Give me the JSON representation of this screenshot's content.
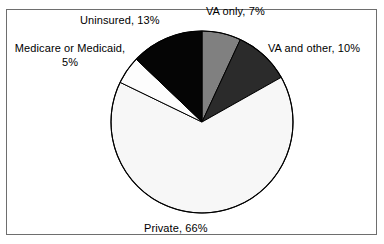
{
  "chart_data": {
    "type": "pie",
    "title": "",
    "subtitle": "",
    "xlabel": "",
    "ylabel": "",
    "legend_position": "none",
    "grid": false,
    "start_angle_deg": 0,
    "direction": "clockwise",
    "categories": [
      "VA only",
      "VA and other",
      "Private",
      "Medicare or Medicaid",
      "Uninsured"
    ],
    "values": [
      7,
      10,
      66,
      5,
      13
    ],
    "unit": "%",
    "total": 101,
    "slices": [
      {
        "name": "VA only",
        "value": 7,
        "label": "VA only, 7%",
        "color": "#808080",
        "stroke": "#000000"
      },
      {
        "name": "VA and other",
        "value": 10,
        "label": "VA and other, 10%",
        "color": "#2b2b2b",
        "stroke": "#000000"
      },
      {
        "name": "Private",
        "value": 66,
        "label": "Private, 66%",
        "color": "#f7f7f7",
        "stroke": "#000000"
      },
      {
        "name": "Medicare or Medicaid",
        "value": 5,
        "label_line1": "Medicare or Medicaid,",
        "label_line2": "5%",
        "label": "Medicare or Medicaid, 5%",
        "color": "#fdfdfd",
        "stroke": "#000000"
      },
      {
        "name": "Uninsured",
        "value": 13,
        "label": "Uninsured, 13%",
        "color": "#050505",
        "stroke": "#000000"
      }
    ]
  },
  "figure": {
    "background_color": "#ffffff",
    "frame_color": "#6e6e6e",
    "text_color": "#000000"
  }
}
